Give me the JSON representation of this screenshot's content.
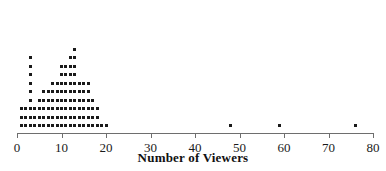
{
  "chart_data": {
    "type": "dotplot",
    "title": "",
    "xlabel": "Number of Viewers",
    "ylabel": "",
    "xlim": [
      0,
      80
    ],
    "xticks": [
      0,
      10,
      20,
      30,
      40,
      50,
      60,
      70,
      80
    ],
    "xticklabels": [
      "0",
      "10",
      "20",
      "30",
      "40",
      "50",
      "60",
      "70",
      "80"
    ],
    "grid": false,
    "legend": null,
    "dot_color": "#1a1a1a",
    "axis_color": "#6e6e6e",
    "categories": [
      1,
      2,
      3,
      4,
      5,
      6,
      7,
      8,
      9,
      10,
      11,
      12,
      13,
      14,
      15,
      16,
      17,
      18,
      19,
      20,
      48,
      59,
      76
    ],
    "values": [
      3,
      3,
      9,
      3,
      4,
      5,
      5,
      6,
      6,
      8,
      8,
      9,
      10,
      6,
      6,
      6,
      4,
      3,
      1,
      1,
      1,
      1,
      1
    ],
    "annotations": []
  },
  "axis": {
    "title": "Number of Viewers"
  }
}
